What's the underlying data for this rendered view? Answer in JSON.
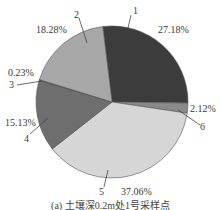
{
  "chart_data": {
    "type": "pie",
    "title": "(a) 土壤深0.2m处1号采样点",
    "start_angle_deg_clockwise_from_top": -7,
    "direction": "clockwise",
    "slices": [
      {
        "label": "1",
        "value": 27.18,
        "value_label": "27.18%",
        "color": "#3c3c3c"
      },
      {
        "label": "6",
        "value": 2.12,
        "value_label": "2.12%",
        "color": "#8a8a8a"
      },
      {
        "label": "5",
        "value": 37.06,
        "value_label": "37.06%",
        "color": "#d6d6d6"
      },
      {
        "label": "4",
        "value": 15.13,
        "value_label": "15.13%",
        "color": "#6e6e6e"
      },
      {
        "label": "3",
        "value": 0.23,
        "value_label": "0.23%",
        "color": "#4a4a4a"
      },
      {
        "label": "2",
        "value": 18.28,
        "value_label": "18.28%",
        "color": "#a8a8a8"
      }
    ],
    "legend": "none (leader-line labels)"
  },
  "labels": {
    "s1_num": "1",
    "s1_pct": "27.18%",
    "s2_num": "2",
    "s2_pct": "18.28%",
    "s3_num": "3",
    "s3_pct": "0.23%",
    "s4_num": "4",
    "s4_pct": "15.13%",
    "s5_num": "5",
    "s5_pct": "37.06%",
    "s6_num": "6",
    "s6_pct": "2.12%"
  },
  "caption": "(a) 土壤深0.2m处1号采样点"
}
